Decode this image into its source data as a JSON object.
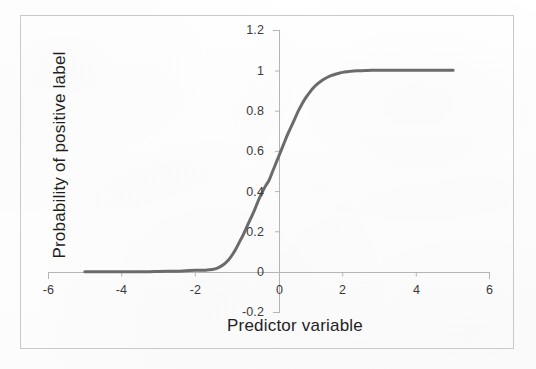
{
  "chart_data": {
    "type": "line",
    "title": "",
    "xlabel": "Predictor variable",
    "ylabel": "Probability of positive label",
    "xlim": [
      -6,
      6
    ],
    "ylim": [
      -0.2,
      1.2
    ],
    "xticks": [
      "-6",
      "-4",
      "-2",
      "0",
      "2",
      "4",
      "6"
    ],
    "xtick_values": [
      -6,
      -4,
      -2,
      0,
      2,
      4,
      6
    ],
    "yticks": [
      "-0.2",
      "0",
      "0.2",
      "0.4",
      "0.6",
      "0.8",
      "1",
      "1.2"
    ],
    "ytick_values": [
      -0.2,
      0,
      0.2,
      0.4,
      0.6,
      0.8,
      1,
      1.2
    ],
    "grid": false,
    "legend": null,
    "series": [
      {
        "name": "logistic response",
        "color": "#6b6b6b",
        "line_width": 3,
        "x": [
          -5.0,
          -4.75,
          -4.5,
          -4.25,
          -4.0,
          -3.75,
          -3.5,
          -3.25,
          -3.0,
          -2.75,
          -2.5,
          -2.25,
          -2.0,
          -1.85,
          -1.7,
          -1.55,
          -1.4,
          -1.25,
          -1.1,
          -1.0,
          -0.9,
          -0.8,
          -0.7,
          -0.6,
          -0.5,
          -0.4,
          -0.3,
          -0.2,
          -0.1,
          0.0,
          0.1,
          0.2,
          0.3,
          0.4,
          0.5,
          0.6,
          0.7,
          0.8,
          0.9,
          1.0,
          1.1,
          1.2,
          1.3,
          1.4,
          1.5,
          1.6,
          1.7,
          1.8,
          1.9,
          2.0,
          2.1,
          2.2,
          2.3,
          2.4,
          2.6,
          2.8,
          3.0,
          3.25,
          3.5,
          3.75,
          4.0,
          4.25,
          4.5,
          4.75,
          5.0
        ],
        "y": [
          0.002,
          0.002,
          0.002,
          0.002,
          0.002,
          0.002,
          0.002,
          0.002,
          0.003,
          0.004,
          0.005,
          0.007,
          0.009,
          0.009,
          0.01,
          0.013,
          0.02,
          0.035,
          0.06,
          0.085,
          0.115,
          0.15,
          0.185,
          0.225,
          0.265,
          0.305,
          0.35,
          0.39,
          0.425,
          0.455,
          0.5,
          0.545,
          0.59,
          0.635,
          0.68,
          0.72,
          0.76,
          0.8,
          0.835,
          0.865,
          0.89,
          0.912,
          0.93,
          0.945,
          0.957,
          0.967,
          0.975,
          0.981,
          0.986,
          0.99,
          0.993,
          0.995,
          0.997,
          0.998,
          0.999,
          1.0,
          1.0,
          1.0,
          1.0,
          1.0,
          1.0,
          1.0,
          1.0,
          1.0,
          1.0
        ]
      }
    ]
  },
  "axes": {
    "x_title": "Predictor variable",
    "y_title": "Probability of positive label"
  },
  "colors": {
    "curve": "#6b6b6b",
    "axis": "#b5b5b5",
    "frame": "#c9c9c9",
    "tick_text": "#3a3a3a",
    "title_text": "#1f1f1f",
    "background": "#fefefe"
  }
}
